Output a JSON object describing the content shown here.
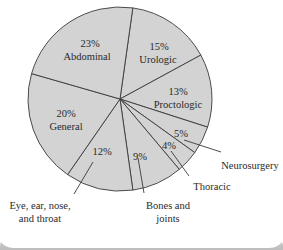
{
  "chart_data": {
    "type": "pie",
    "title": "",
    "start_angle_deg": 8,
    "direction": "clockwise",
    "fill_color": "#d3d3d3",
    "stroke_color": "#3a3a3a",
    "slices": [
      {
        "label": "Urologic",
        "value": 15,
        "pct_text": "15%"
      },
      {
        "label": "Proctologic",
        "value": 13,
        "pct_text": "13%"
      },
      {
        "label": "Neurosurgery",
        "value": 5,
        "pct_text": "5%"
      },
      {
        "label": "Thoracic",
        "value": 4,
        "pct_text": "4%"
      },
      {
        "label": "Bones and joints",
        "value": 9,
        "pct_text": "9%"
      },
      {
        "label": "Eye, ear, nose, and throat",
        "value": 12,
        "pct_text": "12%"
      },
      {
        "label": "General",
        "value": 20,
        "pct_text": "20%"
      },
      {
        "label": "Abdominal",
        "value": 23,
        "pct_text": "23%"
      }
    ]
  },
  "labels": {
    "abdominal": {
      "pct": "23%",
      "name": "Abdominal"
    },
    "urologic": {
      "pct": "15%",
      "name": "Urologic"
    },
    "proctologic": {
      "pct": "13%",
      "name": "Proctologic"
    },
    "general": {
      "pct": "20%",
      "name": "General"
    },
    "eent": {
      "pct": "12%",
      "name_line1": "Eye, ear, nose,",
      "name_line2": "and throat"
    },
    "bones": {
      "pct": "9%",
      "name_line1": "Bones and",
      "name_line2": "joints"
    },
    "thoracic": {
      "pct": "4%",
      "name": "Thoracic"
    },
    "neurosurgery": {
      "pct": "5%",
      "name": "Neurosurgery"
    }
  }
}
